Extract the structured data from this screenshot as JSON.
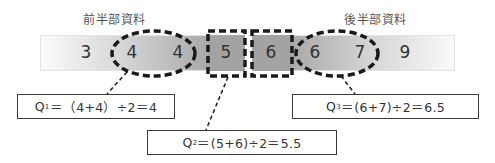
{
  "labels": {
    "first_half": "前半部資料",
    "second_half": "後半部資料"
  },
  "values": [
    "3",
    "4",
    "4",
    "5",
    "6",
    "6",
    "7",
    "9"
  ],
  "formulas": {
    "q1": {
      "name": "Q",
      "sub": "1",
      "expr": "＝（4+4）÷2＝4"
    },
    "q2": {
      "name": "Q",
      "sub": "2",
      "expr": "＝(5+6)÷2＝5.5"
    },
    "q3": {
      "name": "Q",
      "sub": "3",
      "expr": "＝(6+7)÷2＝6.5"
    }
  },
  "colors": {
    "bar_light": "#fbfbfb",
    "bar_dark": "#a3a3a3",
    "dash": "#1a1a1a",
    "box_border": "#3a3a3a",
    "text": "#333333"
  }
}
